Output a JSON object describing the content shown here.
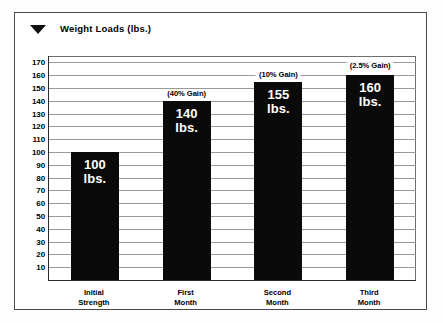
{
  "legend": {
    "marker_icon": "down-triangle-marker",
    "label": "Weight Loads (lbs.)"
  },
  "chart_data": {
    "type": "bar",
    "title": "Weight Loads (lbs.)",
    "xlabel": "",
    "ylabel": "",
    "categories": [
      "Initial Strength",
      "First Month",
      "Second Month",
      "Third Month"
    ],
    "category_lines": [
      {
        "l1": "Initial",
        "l2": "Strength"
      },
      {
        "l1": "First",
        "l2": "Month"
      },
      {
        "l1": "Second",
        "l2": "Month"
      },
      {
        "l1": "Third",
        "l2": "Month"
      }
    ],
    "values": [
      100,
      140,
      155,
      160
    ],
    "bar_labels": [
      {
        "value": "100",
        "unit": "lbs."
      },
      {
        "value": "140",
        "unit": "lbs."
      },
      {
        "value": "155",
        "unit": "lbs."
      },
      {
        "value": "160",
        "unit": "lbs."
      }
    ],
    "annotations": [
      {
        "text": "",
        "at_category": "Initial Strength",
        "at_value": 100
      },
      {
        "text": "(40% Gain)",
        "at_category": "First Month",
        "at_value": 145
      },
      {
        "text": "(10% Gain)",
        "at_category": "Second Month",
        "at_value": 160
      },
      {
        "text": "(2.5% Gain)",
        "at_category": "Third Month",
        "at_value": 167
      }
    ],
    "ylim": [
      0,
      175
    ],
    "yticks": [
      170,
      160,
      150,
      140,
      130,
      120,
      110,
      100,
      90,
      80,
      70,
      60,
      50,
      40,
      30,
      20,
      10
    ],
    "ytick_labels": [
      "170",
      "160",
      "150",
      "140",
      "130",
      "120",
      "110",
      "100",
      "90",
      "80",
      "70",
      "60",
      "50",
      "40",
      "30",
      "20",
      "10"
    ],
    "grid": true,
    "legend_position": "top-left",
    "bar_color": "#0a0a0a",
    "grid_color": "#9a9a9a",
    "axis_color": "#2b2b2b",
    "label_text_color": "#ffffff"
  }
}
